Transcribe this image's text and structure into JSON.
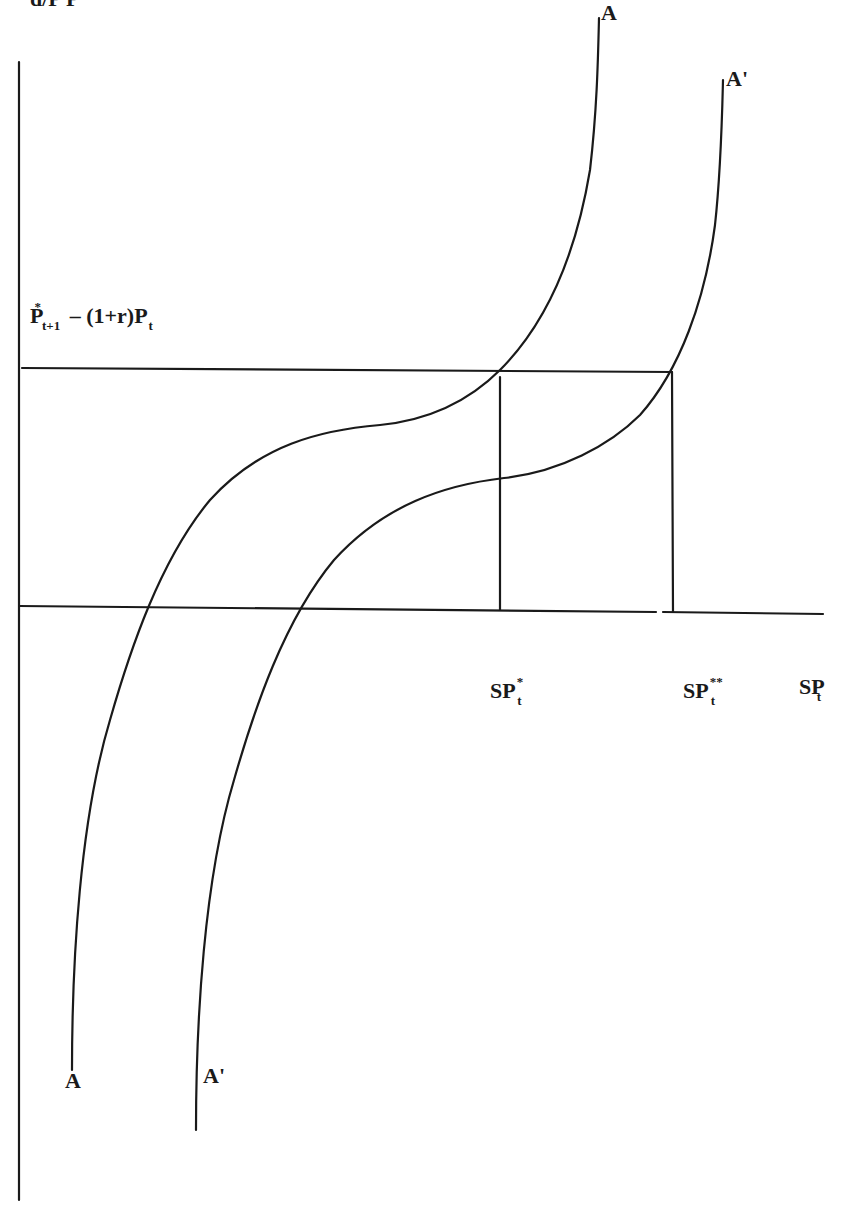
{
  "diagram": {
    "top_label_cut": "d/P    P",
    "y_reference_label": {
      "main": "P",
      "sup": "*",
      "sub": "t+1",
      "rest": "– (1+r)P",
      "rest_sub": "t"
    },
    "curve_A": {
      "top_label": "A",
      "bottom_label": "A"
    },
    "curve_A_prime": {
      "top_label": "A'",
      "bottom_label": "A'"
    },
    "x_labels": [
      {
        "main": "SP",
        "sup": "*",
        "sub": "t"
      },
      {
        "main": "SP",
        "sup": "**",
        "sub": "t"
      },
      {
        "main": "SP",
        "sup": "",
        "sub": "t"
      }
    ],
    "line_color": "#1a1a1a"
  }
}
